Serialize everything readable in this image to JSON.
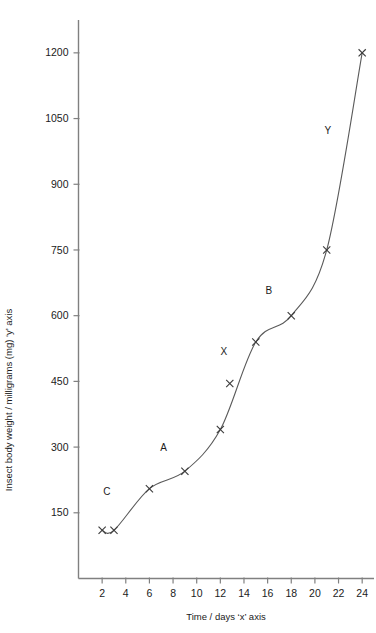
{
  "chart_data": {
    "type": "line",
    "title": "",
    "xlabel": "Time / days ‘x’ axis",
    "ylabel": "Insect body weight / milligrams (mg) ‘y’ axis",
    "xlim": [
      0,
      25
    ],
    "ylim": [
      0,
      1275
    ],
    "grid": false,
    "legend": "none",
    "xticks": [
      2,
      4,
      6,
      8,
      10,
      12,
      14,
      16,
      18,
      20,
      22,
      24
    ],
    "yticks": [
      150,
      300,
      450,
      600,
      750,
      900,
      1050,
      1200
    ],
    "xtick_labels": [
      "2",
      "4",
      "6",
      "8",
      "10",
      "12",
      "14",
      "16",
      "18",
      "20",
      "22",
      "24"
    ],
    "ytick_labels": [
      "150",
      "300",
      "450",
      "600",
      "750",
      "900",
      "1050",
      "1200"
    ],
    "series": [
      {
        "name": "Insect body weight",
        "marker": "x",
        "x": [
          2,
          3,
          6,
          9,
          12,
          15,
          18,
          21,
          24
        ],
        "y": [
          110,
          110,
          205,
          245,
          340,
          540,
          600,
          750,
          1200
        ]
      },
      {
        "name": "Off-curve plotted point",
        "marker": "x",
        "line": "none",
        "x": [
          12.8
        ],
        "y": [
          445
        ]
      }
    ],
    "annotations": [
      {
        "text": "C",
        "x": 2.4,
        "y": 190
      },
      {
        "text": "A",
        "x": 7.2,
        "y": 290
      },
      {
        "text": "X",
        "x": 12.3,
        "y": 510
      },
      {
        "text": "B",
        "x": 16.1,
        "y": 650
      },
      {
        "text": "Y",
        "x": 21.1,
        "y": 1015
      }
    ]
  },
  "axes": {
    "y_axis_title": "Insect body weight / milligrams (mg) ‘y’ axis",
    "x_axis_title": "Time / days ‘x’ axis",
    "y_labels": [
      "1200",
      "1050",
      "900",
      "750",
      "600",
      "450",
      "300",
      "150"
    ],
    "x_labels": [
      "2",
      "4",
      "6",
      "8",
      "10",
      "12",
      "14",
      "16",
      "18",
      "20",
      "22",
      "24"
    ]
  },
  "annotations": {
    "c": "C",
    "a": "A",
    "x": "X",
    "b": "B",
    "y": "Y"
  },
  "colors": {
    "axis": "#808080",
    "curve": "#5a5a5a",
    "marker": "#3a3a3a",
    "text": "#1b1b1b",
    "background": "#ffffff"
  }
}
